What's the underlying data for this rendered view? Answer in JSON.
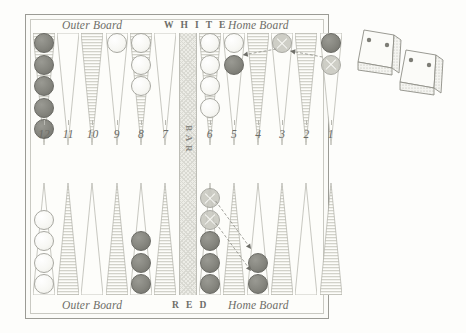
{
  "diagram": {
    "type": "backgammon-board",
    "top_player": "W H I T E",
    "bottom_player": "R E D",
    "bar_label": "B A R",
    "labels": {
      "outer_board": "Outer Board",
      "home_board": "Home Board"
    },
    "point_numbers": [
      "12",
      "11",
      "10",
      "9",
      "8",
      "7",
      "6",
      "5",
      "4",
      "3",
      "2",
      "1"
    ],
    "colors": {
      "red_checker": "#85857e",
      "white_checker": "#f7f7f3",
      "point_shaded": "#d2d2ca",
      "point_light": "#fdfdfa",
      "frame": "#9b9b95",
      "bar_fill": "#ecece6",
      "text": "#6d6d68"
    },
    "top_row": [
      {
        "number": "12",
        "red": 5,
        "white": 0,
        "ghost": 0
      },
      {
        "number": "11",
        "red": 0,
        "white": 0,
        "ghost": 0
      },
      {
        "number": "10",
        "red": 0,
        "white": 0,
        "ghost": 0
      },
      {
        "number": "9",
        "red": 0,
        "white": 1,
        "ghost": 0
      },
      {
        "number": "8",
        "red": 0,
        "white": 3,
        "ghost": 0
      },
      {
        "number": "7",
        "red": 0,
        "white": 0,
        "ghost": 0
      },
      {
        "number": "6",
        "red": 0,
        "white": 4,
        "ghost": 0
      },
      {
        "number": "5",
        "red": 1,
        "white": 1,
        "ghost": 0
      },
      {
        "number": "4",
        "red": 0,
        "white": 0,
        "ghost": 0
      },
      {
        "number": "3",
        "red": 0,
        "white": 0,
        "ghost": 1
      },
      {
        "number": "2",
        "red": 0,
        "white": 0,
        "ghost": 0
      },
      {
        "number": "1",
        "red": 1,
        "white": 0,
        "ghost": 1
      }
    ],
    "bottom_row": [
      {
        "number": "12",
        "red": 0,
        "white": 4,
        "ghost": 0
      },
      {
        "number": "11",
        "red": 0,
        "white": 0,
        "ghost": 0
      },
      {
        "number": "10",
        "red": 0,
        "white": 0,
        "ghost": 0
      },
      {
        "number": "9",
        "red": 0,
        "white": 0,
        "ghost": 0
      },
      {
        "number": "8",
        "red": 3,
        "white": 0,
        "ghost": 0
      },
      {
        "number": "7",
        "red": 0,
        "white": 0,
        "ghost": 0
      },
      {
        "number": "6",
        "red": 3,
        "white": 0,
        "ghost": 2
      },
      {
        "number": "5",
        "red": 0,
        "white": 0,
        "ghost": 0
      },
      {
        "number": "4",
        "red": 2,
        "white": 0,
        "ghost": 0
      },
      {
        "number": "3",
        "red": 0,
        "white": 0,
        "ghost": 0
      },
      {
        "number": "2",
        "red": 0,
        "white": 0,
        "ghost": 0
      },
      {
        "number": "1",
        "red": 0,
        "white": 0,
        "ghost": 0
      }
    ],
    "moves": [
      {
        "from_point": "3",
        "to_point": "5",
        "half": "top"
      },
      {
        "from_point": "1",
        "to_point": "3",
        "half": "top"
      },
      {
        "from_point": "6",
        "to_point": "4",
        "half": "bottom"
      },
      {
        "from_point": "6",
        "to_point": "4",
        "half": "bottom"
      }
    ],
    "dice": [
      {
        "value": 2,
        "face_pips": [
          2,
          2
        ]
      },
      {
        "value": 2,
        "face_pips": [
          2,
          2
        ]
      }
    ]
  }
}
